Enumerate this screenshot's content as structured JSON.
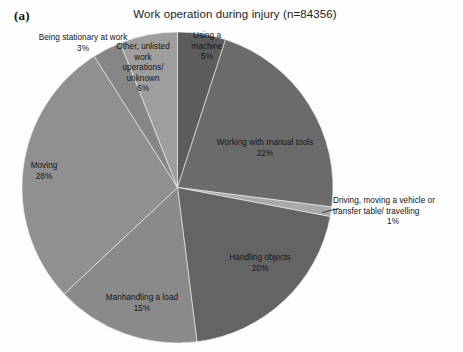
{
  "panel": {
    "label": "(a)"
  },
  "header": {
    "title": "Work operation during injury (n=84356)"
  },
  "chart_data": {
    "type": "pie",
    "title": "Work operation during injury (n=84356)",
    "panel_label": "(a)",
    "total_n": 84356,
    "units": "percent",
    "start_angle_deg": 0,
    "direction": "clockwise",
    "legend": "none (direct labels)",
    "categories": [
      "Using a machine",
      "Working with manual tools",
      "Driving, moving a vehicle  or transfer table/ travelling",
      "Handling objects",
      "Manhandling a load",
      "Moving",
      "Being stationary at work",
      "Other, unlisted work operations/ unknown"
    ],
    "values": [
      5,
      22,
      1,
      20,
      15,
      28,
      3,
      6
    ],
    "colors": [
      "#5c5c5c",
      "#6b6b6b",
      "#a9a9a9",
      "#646464",
      "#8a8a8a",
      "#909090",
      "#868686",
      "#9e9e9e"
    ],
    "slices": [
      {
        "name": "Using a machine",
        "value": 5,
        "label": "Using a\nmachine",
        "pct_text": "5%",
        "color": "#5c5c5c"
      },
      {
        "name": "Working with manual tools",
        "value": 22,
        "label": "Working with manual tools",
        "pct_text": "22%",
        "color": "#6b6b6b"
      },
      {
        "name": "Driving, moving a vehicle",
        "value": 1,
        "label": "Driving, moving a vehicle  or transfer table/ travelling",
        "pct_text": "1%",
        "color": "#a9a9a9"
      },
      {
        "name": "Handling objects",
        "value": 20,
        "label": "Handling objects",
        "pct_text": "20%",
        "color": "#646464"
      },
      {
        "name": "Manhandling a load",
        "value": 15,
        "label": "Manhandling a load",
        "pct_text": "15%",
        "color": "#8a8a8a"
      },
      {
        "name": "Moving",
        "value": 28,
        "label": "Moving",
        "pct_text": "28%",
        "color": "#909090"
      },
      {
        "name": "Being stationary at work",
        "value": 3,
        "label": "Being stationary at work",
        "pct_text": "3%",
        "color": "#868686"
      },
      {
        "name": "Other, unlisted work operations/unknown",
        "value": 6,
        "label": "Other, unlisted work operations/ unknown",
        "pct_text": "6%",
        "color": "#9e9e9e"
      }
    ]
  },
  "labels": {
    "machine": {
      "line1": "Using a",
      "line2": "machine",
      "pct": "5%"
    },
    "tools": {
      "line1": "Working with manual tools",
      "pct": "22%"
    },
    "driving": {
      "line1": "Driving, moving a vehicle  or",
      "line2": "transfer table/ travelling",
      "pct": "1%"
    },
    "handling": {
      "line1": "Handling objects",
      "pct": "20%"
    },
    "manhandling": {
      "line1": "Manhandling a load",
      "pct": "15%"
    },
    "moving": {
      "line1": "Moving",
      "pct": "28%"
    },
    "stationary": {
      "line1": "Being stationary at work",
      "pct": "3%"
    },
    "other": {
      "line1": "Other, unlisted",
      "line2": "work",
      "line3": "operations/",
      "line4": "unknown",
      "pct": "6%"
    }
  }
}
